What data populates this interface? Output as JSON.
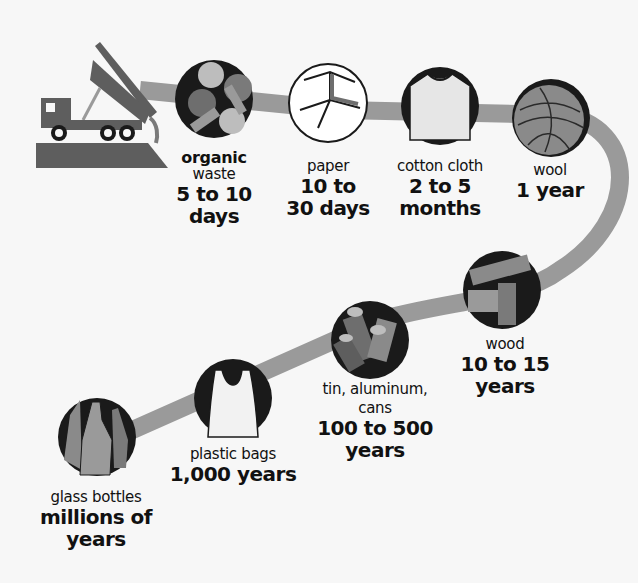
{
  "colors": {
    "background": "#f7f7f7",
    "path": "#9a9a9a",
    "dark": "#1a1a1a",
    "mid": "#6e6e6e",
    "light": "#bdbdbd",
    "text": "#111111"
  },
  "items": [
    {
      "id": "organic",
      "name_bold": "organic",
      "name": "waste",
      "time": "5 to 10 days",
      "time_line1": "5 to 10",
      "time_line2": "days",
      "icon": "vegetables-icon"
    },
    {
      "id": "paper",
      "name": "paper",
      "time": "10 to 30 days",
      "time_line1": "10 to",
      "time_line2": "30 days",
      "icon": "paper-icon"
    },
    {
      "id": "cotton",
      "name": "cotton cloth",
      "time": "2 to 5 months",
      "time_line1": "2 to 5",
      "time_line2": "months",
      "icon": "tshirt-icon"
    },
    {
      "id": "wool",
      "name": "wool",
      "time": "1 year",
      "time_line1": "1 year",
      "icon": "yarn-ball-icon"
    },
    {
      "id": "wood",
      "name": "wood",
      "time": "10 to 15 years",
      "time_line1": "10 to 15",
      "time_line2": "years",
      "icon": "wood-planks-icon"
    },
    {
      "id": "cans",
      "name": "tin, aluminum,",
      "name_line2": "cans",
      "time": "100 to 500 years",
      "time_line1": "100 to 500",
      "time_line2": "years",
      "icon": "cans-icon"
    },
    {
      "id": "plastic",
      "name": "plastic bags",
      "time": "1,000 years",
      "time_line1": "1,000 years",
      "icon": "plastic-bag-icon"
    },
    {
      "id": "glass",
      "name": "glass bottles",
      "time": "millions of years",
      "time_line1": "millions of",
      "time_line2": "years",
      "icon": "glass-bottles-icon"
    }
  ],
  "start_icon": "dump-truck-icon"
}
